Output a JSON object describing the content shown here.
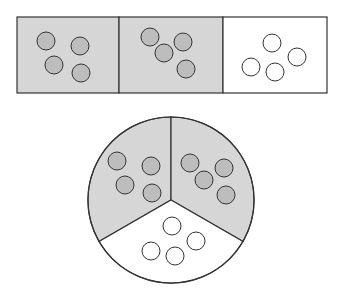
{
  "diagram": {
    "colors": {
      "shaded_fill": "#d6d6d6",
      "counter_shaded_fill": "#bdbdbd",
      "unshaded_fill": "#ffffff",
      "stroke": "#333333"
    },
    "bar_model": {
      "parts": [
        {
          "shaded": true,
          "counters": 4
        },
        {
          "shaded": true,
          "counters": 4
        },
        {
          "shaded": false,
          "counters": 4
        }
      ]
    },
    "circle_model": {
      "parts": [
        {
          "position": "top-left",
          "shaded": true,
          "counters": 4
        },
        {
          "position": "top-right",
          "shaded": true,
          "counters": 4
        },
        {
          "position": "bottom",
          "shaded": false,
          "counters": 4
        }
      ]
    }
  }
}
